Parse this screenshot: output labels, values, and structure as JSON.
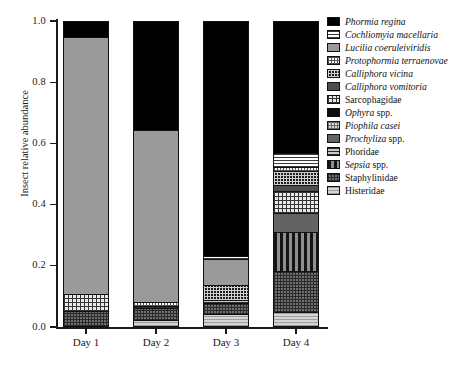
{
  "chart_data": {
    "type": "bar",
    "stacked": true,
    "title": "",
    "xlabel": "",
    "ylabel": "Insect relative abundance",
    "ylim": [
      0.0,
      1.0
    ],
    "yticks": [
      "0.0",
      "0.2",
      "0.4",
      "0.6",
      "0.8",
      "1.0"
    ],
    "ytick_values": [
      0.0,
      0.2,
      0.4,
      0.6,
      0.8,
      1.0
    ],
    "grid": false,
    "legend_position": "right",
    "categories": [
      "Day 1",
      "Day 2",
      "Day 3",
      "Day 4"
    ],
    "series": [
      {
        "name": "Phormia regina",
        "italic": true,
        "pattern": "solid-black",
        "values": [
          0.05,
          0.355,
          0.77,
          0.43
        ]
      },
      {
        "name": "Cochliomyia macellaria",
        "italic": true,
        "pattern": "white-horizontal-lines",
        "values": [
          0.0,
          0.0,
          0.01,
          0.048
        ]
      },
      {
        "name": "Lucilia coeruleiviridis",
        "italic": true,
        "pattern": "solid-mid-gray",
        "values": [
          0.845,
          0.565,
          0.085,
          0.0
        ]
      },
      {
        "name": "Protophormia terraenovae",
        "italic": true,
        "pattern": "white-fine-dots",
        "values": [
          0.0,
          0.013,
          0.0,
          0.012
        ]
      },
      {
        "name": "Calliphora vicina",
        "italic": true,
        "pattern": "dark-checker",
        "values": [
          0.0,
          0.0,
          0.05,
          0.046
        ]
      },
      {
        "name": "Calliphora vomitoria",
        "italic": true,
        "pattern": "solid-dark-gray",
        "values": [
          0.0,
          0.0,
          0.0,
          0.02
        ]
      },
      {
        "name": "Sarcophagidae",
        "italic": false,
        "pattern": "light-checkerboard",
        "values": [
          0.056,
          0.0,
          0.0,
          0.072
        ]
      },
      {
        "name": "Ophyra spp.",
        "italic": true,
        "pattern": "solid-near-black",
        "values": [
          0.0,
          0.0,
          0.0,
          0.0
        ]
      },
      {
        "name": "Piophila casei",
        "italic": true,
        "pattern": "light-dot-grid",
        "values": [
          0.0,
          0.0,
          0.0,
          0.0
        ]
      },
      {
        "name": "Prochyliza spp.",
        "italic": true,
        "pattern": "solid-gray",
        "values": [
          0.0,
          0.0,
          0.0,
          0.062
        ]
      },
      {
        "name": "Phoridae",
        "italic": false,
        "pattern": "gray-horizontal-lines",
        "values": [
          0.0,
          0.007,
          0.008,
          0.0
        ]
      },
      {
        "name": "Sepsia spp.",
        "italic": true,
        "pattern": "vertical-stripes",
        "values": [
          0.0,
          0.0,
          0.0,
          0.13
        ]
      },
      {
        "name": "Staphylinidae",
        "italic": false,
        "pattern": "dark-dense-checker",
        "values": [
          0.049,
          0.04,
          0.038,
          0.135
        ]
      },
      {
        "name": "Histeridae",
        "italic": false,
        "pattern": "light-gray-lines",
        "values": [
          0.0,
          0.02,
          0.039,
          0.045
        ]
      }
    ]
  },
  "axis": {
    "y_label": "Insect relative abundance",
    "y_ticks": [
      "1.0",
      "0.8",
      "0.6",
      "0.4",
      "0.2",
      "0.0"
    ],
    "x_ticks": [
      "Day 1",
      "Day 2",
      "Day 3",
      "Day 4"
    ]
  },
  "legend": {
    "items": [
      {
        "label": "Phormia regina",
        "roman_suffix": "",
        "italic": true,
        "swatch": "solid-black"
      },
      {
        "label": "Cochliomyia macellaria",
        "roman_suffix": "",
        "italic": true,
        "swatch": "white-horizontal-lines"
      },
      {
        "label": "Lucilia coeruleiviridis",
        "roman_suffix": "",
        "italic": true,
        "swatch": "solid-mid-gray"
      },
      {
        "label": "Protophormia terraenovae",
        "roman_suffix": "",
        "italic": true,
        "swatch": "white-fine-dots"
      },
      {
        "label": "Calliphora vicina",
        "roman_suffix": "",
        "italic": true,
        "swatch": "dark-checker"
      },
      {
        "label": "Calliphora vomitoria",
        "roman_suffix": "",
        "italic": true,
        "swatch": "solid-dark-gray"
      },
      {
        "label": "Sarcophagidae",
        "roman_suffix": "",
        "italic": false,
        "swatch": "light-checkerboard"
      },
      {
        "label": "Ophyra",
        "roman_suffix": " spp.",
        "italic": true,
        "swatch": "solid-near-black"
      },
      {
        "label": "Piophila casei",
        "roman_suffix": "",
        "italic": true,
        "swatch": "light-dot-grid"
      },
      {
        "label": "Prochyliza",
        "roman_suffix": " spp.",
        "italic": true,
        "swatch": "solid-gray"
      },
      {
        "label": "Phoridae",
        "roman_suffix": "",
        "italic": false,
        "swatch": "gray-horizontal-lines"
      },
      {
        "label": "Sepsia",
        "roman_suffix": " spp.",
        "italic": true,
        "swatch": "vertical-stripes"
      },
      {
        "label": "Staphylinidae",
        "roman_suffix": "",
        "italic": false,
        "swatch": "dark-dense-checker"
      },
      {
        "label": "Histeridae",
        "roman_suffix": "",
        "italic": false,
        "swatch": "light-gray-lines"
      }
    ]
  },
  "colors": {
    "axis": "#1a1a1a",
    "background": "#ffffff",
    "outline": "#111111"
  }
}
